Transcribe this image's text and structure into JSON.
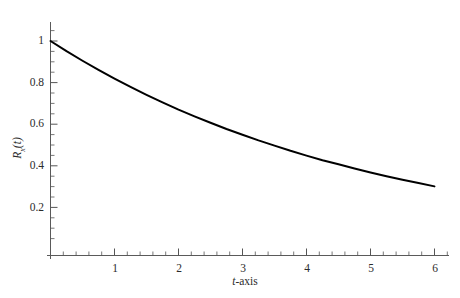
{
  "chart_data": {
    "type": "line",
    "title": "",
    "subtitle": "",
    "xlabel": "t-axis",
    "xlabel_parts": {
      "variable": "t",
      "suffix": "-axis"
    },
    "ylabel": "R_x(t)",
    "ylabel_parts": {
      "symbol": "R",
      "subscript": "x",
      "argument": "(t)"
    },
    "xlim": [
      0,
      6.2
    ],
    "ylim": [
      0,
      1.08
    ],
    "grid": false,
    "legend": null,
    "x_major_ticks": [
      1,
      2,
      3,
      4,
      5,
      6
    ],
    "x_major_tick_labels": [
      "1",
      "2",
      "3",
      "4",
      "5",
      "6"
    ],
    "x_minor_tick_interval": 0.2,
    "y_major_ticks": [
      0.2,
      0.4,
      0.6,
      0.8,
      1
    ],
    "y_major_tick_labels": [
      "0.2",
      "0.4",
      "0.6",
      "0.8",
      "1"
    ],
    "y_minor_tick_interval": 0.05,
    "line_color": "#000000",
    "line_width": 2.0,
    "axis_color": "#555555",
    "series": [
      {
        "name": "Rx(t)",
        "x": [
          0,
          0.25,
          0.5,
          0.75,
          1,
          1.25,
          1.5,
          1.75,
          2,
          2.25,
          2.5,
          2.75,
          3,
          3.25,
          3.5,
          3.75,
          4,
          4.25,
          4.5,
          4.75,
          5,
          5.25,
          5.5,
          5.75,
          6
        ],
        "values": [
          1.0,
          0.951,
          0.905,
          0.861,
          0.819,
          0.779,
          0.741,
          0.705,
          0.67,
          0.638,
          0.607,
          0.577,
          0.549,
          0.522,
          0.497,
          0.472,
          0.449,
          0.427,
          0.407,
          0.387,
          0.368,
          0.35,
          0.333,
          0.317,
          0.301
        ]
      }
    ],
    "annotations": []
  },
  "axes": {
    "y_tick_labels": [
      "1",
      "0.8",
      "0.6",
      "0.4",
      "0.2"
    ],
    "x_tick_labels": [
      "1",
      "2",
      "3",
      "4",
      "5",
      "6"
    ]
  }
}
